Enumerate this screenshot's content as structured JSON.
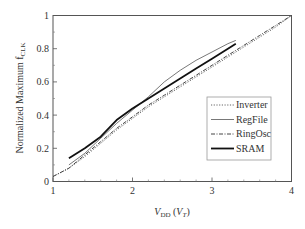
{
  "chart_data": {
    "type": "line",
    "title": "",
    "xlabel": "V_DD (V_T)",
    "xlabel_main": "V",
    "xlabel_sub": "DD",
    "xlabel_paren_main": "V",
    "xlabel_paren_sub": "T",
    "ylabel": "Normalized Maximum f_CLK",
    "ylabel_main": "Normalized Maximum f",
    "ylabel_sub": "CLK",
    "xlim": [
      1,
      4
    ],
    "ylim": [
      0,
      1
    ],
    "xticks": [
      1,
      2,
      3,
      4
    ],
    "xtick_labels": [
      "1",
      "2",
      "3",
      "4"
    ],
    "yticks": [
      0,
      0.2,
      0.4,
      0.6,
      0.8,
      1
    ],
    "ytick_labels": [
      "0",
      "0.2",
      "0.4",
      "0.6",
      "0.8",
      "1"
    ],
    "grid": false,
    "legend_position": "lower right",
    "series": [
      {
        "name": "Inverter",
        "style": "dotted",
        "x": [
          1.0,
          1.2,
          1.4,
          1.6,
          1.8,
          2.0,
          2.2,
          2.4,
          2.6,
          2.8,
          3.0,
          3.2,
          3.4,
          3.6,
          3.8,
          4.0
        ],
        "y": [
          0.03,
          0.08,
          0.15,
          0.23,
          0.31,
          0.38,
          0.45,
          0.51,
          0.57,
          0.63,
          0.69,
          0.75,
          0.81,
          0.87,
          0.93,
          1.0
        ]
      },
      {
        "name": "RegFile",
        "style": "solid-thin",
        "x": [
          1.2,
          1.4,
          1.6,
          1.8,
          2.0,
          2.2,
          2.4,
          2.6,
          2.8,
          3.0,
          3.2,
          3.3
        ],
        "y": [
          0.1,
          0.17,
          0.26,
          0.35,
          0.43,
          0.51,
          0.6,
          0.67,
          0.73,
          0.78,
          0.83,
          0.85
        ]
      },
      {
        "name": "RingOsc",
        "style": "dash-dot",
        "x": [
          1.0,
          1.2,
          1.4,
          1.6,
          1.8,
          2.0,
          2.2,
          2.4,
          2.6,
          2.8,
          3.0,
          3.2,
          3.4,
          3.6,
          3.8,
          4.0
        ],
        "y": [
          0.03,
          0.08,
          0.16,
          0.24,
          0.32,
          0.39,
          0.46,
          0.52,
          0.58,
          0.64,
          0.7,
          0.76,
          0.82,
          0.88,
          0.94,
          1.0
        ]
      },
      {
        "name": "SRAM",
        "style": "solid-thick",
        "x": [
          1.2,
          1.4,
          1.6,
          1.8,
          2.0,
          2.2,
          2.4,
          2.6,
          2.8,
          3.0,
          3.2,
          3.3
        ],
        "y": [
          0.14,
          0.2,
          0.27,
          0.37,
          0.44,
          0.5,
          0.56,
          0.62,
          0.68,
          0.74,
          0.8,
          0.83
        ]
      }
    ]
  }
}
